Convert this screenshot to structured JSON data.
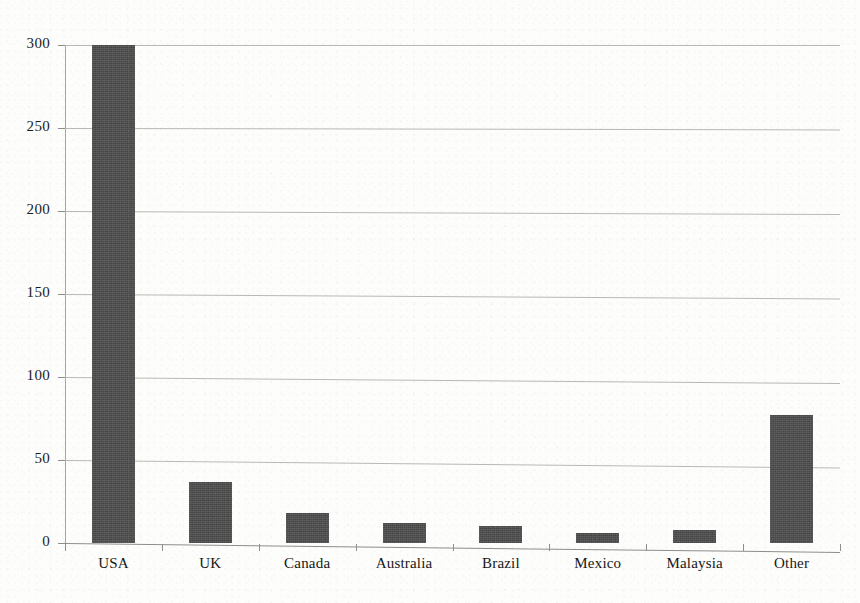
{
  "chart_data": {
    "type": "bar",
    "title": "",
    "subtitle": "",
    "xlabel": "",
    "ylabel": "",
    "categories": [
      "USA",
      "UK",
      "Canada",
      "Australia",
      "Brazil",
      "Mexico",
      "Malaysia",
      "Other"
    ],
    "values": [
      300,
      37,
      18,
      12,
      10,
      6,
      8,
      77
    ],
    "ylim": [
      0,
      300
    ],
    "yticks": [
      0,
      50,
      100,
      150,
      200,
      250,
      300
    ],
    "ytick_labels": [
      "0",
      "50",
      "100",
      "150",
      "200",
      "250",
      "300"
    ],
    "grid": true,
    "legend": "none",
    "series": [
      {
        "name": "Count",
        "values": [
          300,
          37,
          18,
          12,
          10,
          6,
          8,
          77
        ]
      }
    ],
    "bar_color": "#4e4e4e",
    "gridline_color": "#b9b9b4",
    "axis_color": "#8e8e88",
    "background_color": "#fdfdfc",
    "text_color": "#1c1c1c"
  }
}
